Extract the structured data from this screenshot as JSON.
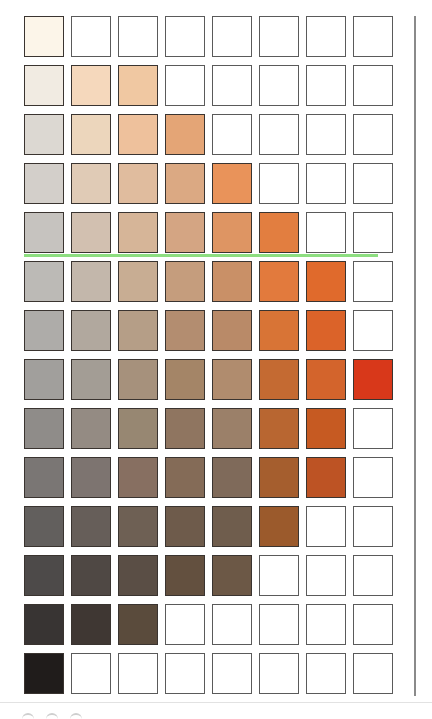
{
  "chart_data": {
    "type": "heatmap",
    "title": "",
    "rows": 14,
    "cols": 8,
    "grid_on": true,
    "highlight_cell": {
      "row": 7,
      "col": 7,
      "color": "#d8381a"
    },
    "cells": [
      [
        "#fcf5e9",
        null,
        null,
        null,
        null,
        null,
        null,
        null
      ],
      [
        "#f1ebe2",
        "#f5d8bc",
        "#f0c8a2",
        null,
        null,
        null,
        null,
        null
      ],
      [
        "#dcd8d2",
        "#ecd6bc",
        "#eec19c",
        "#e4a576",
        null,
        null,
        null,
        null
      ],
      [
        "#d3cfca",
        "#e0cbb6",
        "#e0bc9e",
        "#dba983",
        "#e9935a",
        null,
        null,
        null
      ],
      [
        "#c6c3bf",
        "#d2c0b0",
        "#d6b598",
        "#d4a583",
        "#de9563",
        "#e27e40",
        null,
        null
      ],
      [
        "#bcbab6",
        "#c3b7ab",
        "#c8ad93",
        "#c59d7d",
        "#c99067",
        "#e27a3d",
        "#e06a2c",
        null
      ],
      [
        "#aeaca9",
        "#b1a89e",
        "#b59e87",
        "#b38d70",
        "#b98a68",
        "#d87436",
        "#db6329",
        null
      ],
      [
        "#a19f9c",
        "#a39d95",
        "#a6917c",
        "#a48567",
        "#b08c6e",
        "#c46a32",
        "#d3642c",
        "#d8381a"
      ],
      [
        "#8f8c89",
        "#948b83",
        "#978772",
        "#8f7560",
        "#9b8069",
        "#b86631",
        "#c65a22",
        null
      ],
      [
        "#7a7674",
        "#7d7470",
        "#876f61",
        "#846b57",
        "#7f6a5a",
        "#a55e2e",
        "#bd5324",
        null
      ],
      [
        "#625f5d",
        "#665e59",
        "#6e6054",
        "#6e5b4b",
        "#6f5d4d",
        "#9b5a2c",
        null,
        null
      ],
      [
        "#4d4a49",
        "#4f4844",
        "#5a4e45",
        "#63503f",
        "#6c5846",
        null,
        null,
        null
      ],
      [
        "#383433",
        "#3f3733",
        "#5a4b3c",
        null,
        null,
        null,
        null,
        null
      ],
      [
        "#201c1b",
        null,
        null,
        null,
        null,
        null,
        null,
        null
      ]
    ]
  },
  "legend": [],
  "labels": []
}
